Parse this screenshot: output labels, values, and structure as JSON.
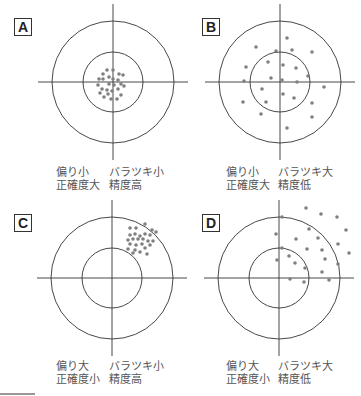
{
  "panels": [
    {
      "id": "A",
      "label": "A",
      "center": [
        113,
        82
      ],
      "label_pos": [
        14,
        18
      ],
      "caption_left": [
        56,
        166
      ],
      "caption_right": [
        109,
        166
      ],
      "bias": "偏り小",
      "accuracy": "正確度大",
      "spread": "バラツキ小",
      "precision": "精度高",
      "dots": [
        [
          107,
          70
        ],
        [
          113,
          70
        ],
        [
          103,
          74
        ],
        [
          119,
          74
        ],
        [
          123,
          75
        ],
        [
          99,
          79
        ],
        [
          103,
          79
        ],
        [
          109,
          77
        ],
        [
          113,
          79
        ],
        [
          118,
          80
        ],
        [
          98,
          85
        ],
        [
          109,
          84
        ],
        [
          114,
          85
        ],
        [
          121,
          84
        ],
        [
          124,
          86
        ],
        [
          102,
          89
        ],
        [
          107,
          90
        ],
        [
          118,
          89
        ],
        [
          112,
          91
        ],
        [
          100,
          93
        ],
        [
          108,
          94
        ],
        [
          121,
          95
        ],
        [
          111,
          99
        ],
        [
          117,
          99
        ],
        [
          104,
          97
        ]
      ]
    },
    {
      "id": "B",
      "label": "B",
      "center": [
        280,
        82
      ],
      "label_pos": [
        202,
        18
      ],
      "caption_left": [
        226,
        166
      ],
      "caption_right": [
        278,
        166
      ],
      "bias": "偏り小",
      "accuracy": "正確度大",
      "spread": "バラツキ大",
      "precision": "精度低",
      "dots": [
        [
          287,
          38
        ],
        [
          256,
          47
        ],
        [
          276,
          51
        ],
        [
          292,
          50
        ],
        [
          312,
          52
        ],
        [
          268,
          62
        ],
        [
          283,
          65
        ],
        [
          296,
          68
        ],
        [
          246,
          67
        ],
        [
          308,
          76
        ],
        [
          271,
          78
        ],
        [
          244,
          81
        ],
        [
          282,
          80
        ],
        [
          297,
          82
        ],
        [
          324,
          87
        ],
        [
          262,
          89
        ],
        [
          283,
          94
        ],
        [
          294,
          98
        ],
        [
          243,
          102
        ],
        [
          266,
          102
        ],
        [
          312,
          103
        ],
        [
          261,
          114
        ],
        [
          312,
          117
        ],
        [
          287,
          128
        ]
      ]
    },
    {
      "id": "C",
      "label": "C",
      "center": [
        112,
        278
      ],
      "label_pos": [
        14,
        214
      ],
      "caption_left": [
        56,
        360
      ],
      "caption_right": [
        109,
        360
      ],
      "bias": "偏り大",
      "accuracy": "正確度小",
      "spread": "バラツキ小",
      "precision": "精度高",
      "dots": [
        [
          130,
          228
        ],
        [
          136,
          228
        ],
        [
          145,
          224
        ],
        [
          152,
          230
        ],
        [
          156,
          232
        ],
        [
          130,
          235
        ],
        [
          135,
          234
        ],
        [
          140,
          236
        ],
        [
          145,
          234
        ],
        [
          150,
          235
        ],
        [
          128,
          240
        ],
        [
          133,
          239
        ],
        [
          138,
          239
        ],
        [
          143,
          239
        ],
        [
          148,
          241
        ],
        [
          153,
          241
        ],
        [
          130,
          244
        ],
        [
          136,
          245
        ],
        [
          142,
          244
        ],
        [
          150,
          245
        ],
        [
          128,
          249
        ],
        [
          135,
          250
        ],
        [
          145,
          248
        ],
        [
          140,
          252
        ],
        [
          147,
          254
        ],
        [
          133,
          253
        ]
      ]
    },
    {
      "id": "D",
      "label": "D",
      "center": [
        279,
        278
      ],
      "label_pos": [
        202,
        214
      ],
      "caption_left": [
        226,
        360
      ],
      "caption_right": [
        278,
        360
      ],
      "bias": "偏り大",
      "accuracy": "正確度小",
      "spread": "バラツキ大",
      "precision": "精度低",
      "dots": [
        [
          306,
          208
        ],
        [
          321,
          214
        ],
        [
          337,
          217
        ],
        [
          282,
          217
        ],
        [
          309,
          229
        ],
        [
          346,
          230
        ],
        [
          276,
          234
        ],
        [
          296,
          239
        ],
        [
          318,
          238
        ],
        [
          338,
          244
        ],
        [
          282,
          248
        ],
        [
          307,
          249
        ],
        [
          322,
          250
        ],
        [
          349,
          253
        ],
        [
          289,
          256
        ],
        [
          325,
          259
        ],
        [
          277,
          260
        ],
        [
          295,
          263
        ],
        [
          338,
          264
        ],
        [
          305,
          268
        ],
        [
          322,
          272
        ],
        [
          290,
          279
        ],
        [
          329,
          280
        ],
        [
          304,
          282
        ]
      ]
    }
  ],
  "geometry": {
    "outer_radius": 61,
    "inner_radius": 30,
    "cross_half_width": 75,
    "cross_half_height": 78,
    "dot_radius": 1.8
  },
  "colors": {
    "line": "#333333",
    "dot": "#808080",
    "caption": "#555555"
  },
  "footer_rule": {
    "x1": 0,
    "x2": 35,
    "y": 394
  }
}
